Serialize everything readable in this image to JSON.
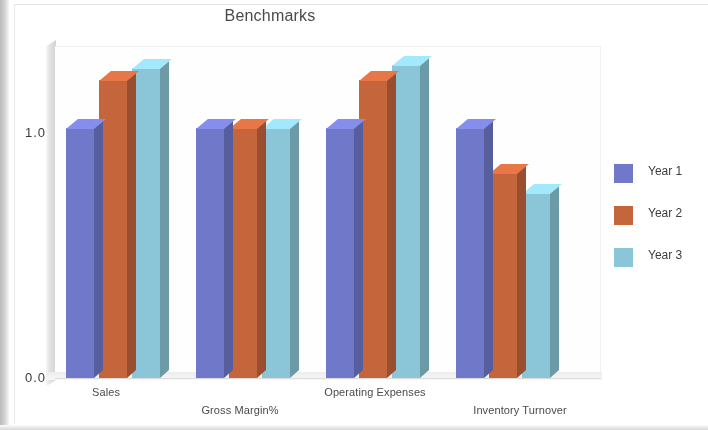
{
  "chart_data": {
    "type": "bar",
    "title": "Benchmarks",
    "xlabel": "",
    "ylabel": "",
    "ylim": [
      0.0,
      1.3
    ],
    "ytick_labels": [
      "1.0",
      "0.0"
    ],
    "grid": false,
    "legend_position": "right",
    "style": "3d-clustered-column",
    "categories": [
      "Sales",
      "Gross Margin%",
      "Operating Expenses",
      "Inventory Turnover"
    ],
    "series": [
      {
        "name": "Year 1",
        "color": "#7078cc",
        "values": [
          1.0,
          1.0,
          1.0,
          1.0
        ]
      },
      {
        "name": "Year 2",
        "color": "#c8643a",
        "values": [
          1.19,
          1.0,
          1.19,
          0.82
        ]
      },
      {
        "name": "Year 3",
        "color": "#88c6d8",
        "values": [
          1.24,
          1.0,
          1.25,
          0.74
        ]
      }
    ]
  },
  "chart": {
    "title": "Benchmarks",
    "axis": {
      "y_top_label": "1.0",
      "y_bottom_label": "0.0"
    },
    "categories": [
      {
        "label": "Sales"
      },
      {
        "label": "Gross Margin%"
      },
      {
        "label": "Operating Expenses"
      },
      {
        "label": "Inventory Turnover"
      }
    ],
    "legend": {
      "items": [
        {
          "label": "Year 1",
          "color": "#7078cc"
        },
        {
          "label": "Year 2",
          "color": "#c8643a"
        },
        {
          "label": "Year 3",
          "color": "#88c6d8"
        }
      ]
    }
  }
}
